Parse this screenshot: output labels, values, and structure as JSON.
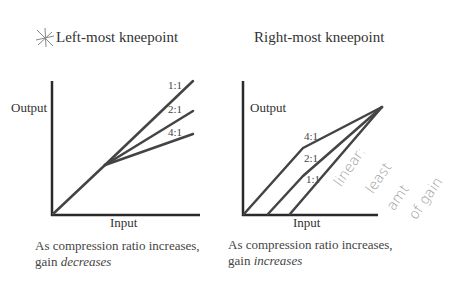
{
  "left_panel": {
    "title": "Left-most kneepoint",
    "icon": "star-icon",
    "y_label": "Output",
    "x_label": "Input",
    "ratios": [
      "1:1",
      "2:1",
      "4:1"
    ],
    "caption_line1": "As compression ratio increases,",
    "caption_line2_prefix": "gain ",
    "caption_line2_emph": "decreases"
  },
  "right_panel": {
    "title": "Right-most kneepoint",
    "y_label": "Output",
    "x_label": "Input",
    "ratios": [
      "4:1",
      "2:1",
      "1:1"
    ],
    "caption_line1": "As compression ratio increases,",
    "caption_line2_prefix": "gain ",
    "caption_line2_emph": "increases",
    "annotation_lines": [
      "linear:",
      "least",
      "amt",
      "of gain"
    ]
  },
  "colors": {
    "line": "#3a3a3a",
    "text": "#333333",
    "annotation": "#aaaaaa"
  }
}
